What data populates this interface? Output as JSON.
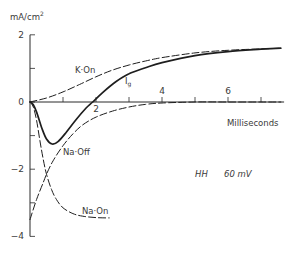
{
  "chart_data": {
    "type": "line",
    "title": "",
    "xlabel": "Milliseconds",
    "ylabel": "mA/cm",
    "ylabel_sup": "2",
    "xlim": [
      0,
      7.7
    ],
    "ylim": [
      -4,
      2
    ],
    "x_ticks": [
      {
        "value": 1,
        "label": ""
      },
      {
        "value": 2,
        "label": "2"
      },
      {
        "value": 3,
        "label": ""
      },
      {
        "value": 4,
        "label": "4"
      },
      {
        "value": 5,
        "label": ""
      },
      {
        "value": 6,
        "label": "6"
      },
      {
        "value": 7,
        "label": ""
      }
    ],
    "y_ticks": [
      {
        "value": 2,
        "label": "2"
      },
      {
        "value": 1,
        "label": ""
      },
      {
        "value": 0,
        "label": "0"
      },
      {
        "value": -1,
        "label": ""
      },
      {
        "value": -2,
        "label": "−2"
      },
      {
        "value": -3,
        "label": ""
      },
      {
        "value": -4,
        "label": "−4"
      }
    ],
    "grid": false,
    "annotation": {
      "model": "HH",
      "voltage": "60 mV"
    },
    "series": [
      {
        "name": "K-On",
        "label": "K·On",
        "style": "dashed",
        "x": [
          0,
          0.5,
          1,
          1.5,
          2,
          2.5,
          3,
          3.5,
          4,
          5,
          6,
          7,
          7.6
        ],
        "y": [
          0,
          0.12,
          0.3,
          0.52,
          0.75,
          0.95,
          1.1,
          1.22,
          1.32,
          1.46,
          1.54,
          1.58,
          1.6
        ]
      },
      {
        "name": "Ig",
        "label": "I",
        "label_sub": "g",
        "style": "solid",
        "x": [
          0,
          0.1,
          0.2,
          0.35,
          0.5,
          0.67,
          0.85,
          1.1,
          1.4,
          1.7,
          1.9,
          2.2,
          2.6,
          3,
          3.5,
          4,
          5,
          6,
          7,
          7.6
        ],
        "y": [
          0,
          -0.08,
          -0.3,
          -0.75,
          -1.1,
          -1.25,
          -1.18,
          -0.9,
          -0.52,
          -0.18,
          0,
          0.28,
          0.6,
          0.84,
          1.02,
          1.17,
          1.38,
          1.5,
          1.57,
          1.6
        ]
      },
      {
        "name": "Na-Off",
        "label": "Na·Off",
        "style": "dashed",
        "x": [
          0,
          0.2,
          0.4,
          0.5,
          0.7,
          1,
          1.3,
          1.6,
          2,
          2.5,
          3,
          3.5,
          4,
          5,
          6,
          7,
          7.6
        ],
        "y": [
          -3.5,
          -2.9,
          -2.4,
          -2.15,
          -1.75,
          -1.3,
          -0.95,
          -0.68,
          -0.45,
          -0.27,
          -0.15,
          -0.07,
          -0.03,
          0,
          0,
          0,
          0
        ]
      },
      {
        "name": "Na-On",
        "label": "Na·On",
        "style": "dashed",
        "x": [
          0,
          0.1,
          0.2,
          0.3,
          0.4,
          0.5,
          0.65,
          0.8,
          1,
          1.3,
          1.6,
          2,
          2.4
        ],
        "y": [
          0,
          -0.15,
          -0.55,
          -1.15,
          -1.7,
          -2.15,
          -2.6,
          -2.9,
          -3.15,
          -3.32,
          -3.4,
          -3.44,
          -3.45
        ]
      }
    ]
  }
}
